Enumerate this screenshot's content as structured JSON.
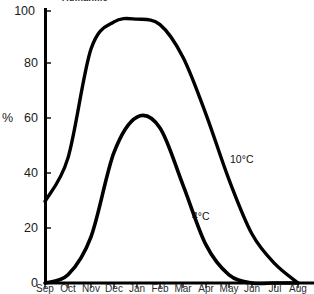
{
  "figure": {
    "title_cropped": "Aufnahme",
    "background_color": "#ffffff",
    "ink_color": "#000000"
  },
  "axes": {
    "y_axis_title": "%",
    "y_ticks": [
      "0",
      "20",
      "40",
      "60",
      "80",
      "100"
    ],
    "x_ticks": [
      "Sep",
      "Oct",
      "Nov",
      "Dec",
      "Jan",
      "Feb",
      "Mar",
      "Apr",
      "May",
      "Jun",
      "Jul",
      "Aug"
    ]
  },
  "annotations": {
    "series_high_label": "10°C",
    "series_low_label": "4°C"
  },
  "chart_data": {
    "type": "line",
    "title": "",
    "xlabel": "",
    "ylabel": "%",
    "ylim": [
      0,
      100
    ],
    "grid": false,
    "legend": "inline-annotations",
    "categories": [
      "Sep",
      "Oct",
      "Nov",
      "Dec",
      "Jan",
      "Feb",
      "Mar",
      "Apr",
      "May",
      "Jun",
      "Jul",
      "Aug"
    ],
    "series": [
      {
        "name": "10°C",
        "values": [
          30,
          46,
          86,
          96,
          97,
          95,
          83,
          62,
          38,
          18,
          7,
          0
        ]
      },
      {
        "name": "4°C",
        "values": [
          0,
          3,
          17,
          48,
          61,
          57,
          36,
          14,
          3,
          0,
          0,
          0
        ]
      }
    ]
  }
}
